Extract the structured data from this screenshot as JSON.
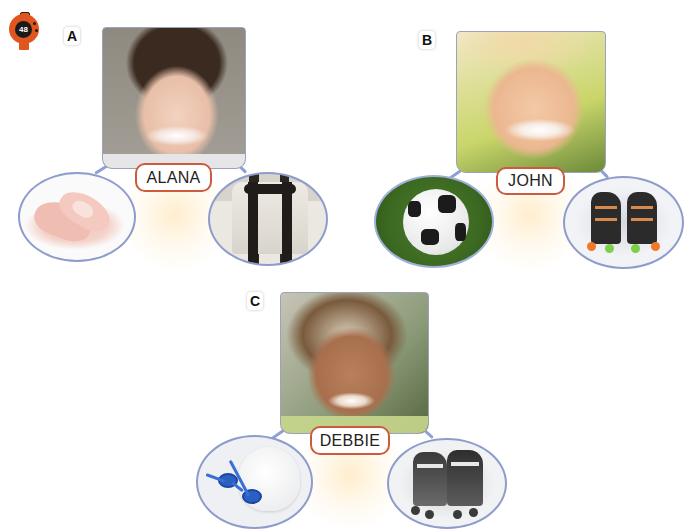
{
  "page": {
    "number": "48",
    "badge_color": "#e0561e"
  },
  "sections": [
    {
      "letter": "A",
      "name": "ALANA",
      "photo": "girl-smiling-portrait",
      "activities": [
        {
          "label": "ballet",
          "icon": "ballet-shoes-icon"
        },
        {
          "label": "karate",
          "icon": "karate-uniform-black-belt-icon"
        }
      ]
    },
    {
      "letter": "B",
      "name": "JOHN",
      "photo": "blond-boy-smiling-portrait",
      "activities": [
        {
          "label": "soccer",
          "icon": "soccer-ball-icon"
        },
        {
          "label": "roller skating",
          "icon": "roller-skates-icon"
        }
      ]
    },
    {
      "letter": "C",
      "name": "DEBBIE",
      "photo": "curly-hair-girl-smiling-portrait",
      "activities": [
        {
          "label": "swimming",
          "icon": "swim-goggles-cap-icon"
        },
        {
          "label": "inline skating",
          "icon": "inline-skates-icon"
        }
      ]
    }
  ],
  "colors": {
    "label_border": "#cc5a3c",
    "circle_border": "#8e9ccc",
    "connector": "#8d9fd6"
  }
}
